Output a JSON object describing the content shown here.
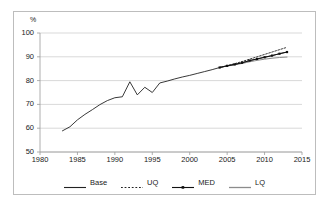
{
  "figure": {
    "caption_remnant": "",
    "background_color": "#ffffff",
    "frame_color": "#bdbdbd"
  },
  "chart_data": {
    "type": "line",
    "title": "",
    "subtitle": "",
    "xlabel": "",
    "ylabel": "%",
    "ylim": [
      50,
      100
    ],
    "xlim": [
      1980,
      2015
    ],
    "ytick_labels": [
      "100",
      "90",
      "80",
      "70",
      "60",
      "50"
    ],
    "yticks": [
      100,
      90,
      80,
      70,
      60,
      50
    ],
    "xtick_labels": [
      "1980",
      "1985",
      "1990",
      "1995",
      "2000",
      "2005",
      "2010",
      "2015"
    ],
    "xticks": [
      1980,
      1985,
      1990,
      1995,
      2000,
      2005,
      2010,
      2015
    ],
    "grid": "horizontal",
    "grid_color": "#c8c8c8",
    "legend_position": "bottom",
    "series": [
      {
        "name": "Base",
        "style": "solid",
        "color": "#222222",
        "marker": "none",
        "x": [
          1983,
          1984,
          1985,
          1986,
          1987,
          1988,
          1989,
          1990,
          1991,
          1992,
          1993,
          1994,
          1995,
          1996,
          1997,
          1998,
          1999,
          2000,
          2001,
          2002,
          2003,
          2004,
          2005,
          2006,
          2007,
          2008,
          2009,
          2010,
          2011,
          2012,
          2013
        ],
        "values": [
          58.9,
          60.6,
          63.5,
          65.8,
          67.8,
          69.9,
          71.6,
          72.8,
          73.2,
          79.5,
          74.0,
          77.2,
          75.0,
          79.0,
          79.8,
          80.7,
          81.5,
          82.2,
          83.0,
          83.8,
          84.6,
          85.5,
          86.2,
          86.8,
          87.5,
          88.4,
          89.1,
          89.8,
          90.5,
          91.3,
          92.0
        ]
      },
      {
        "name": "UQ",
        "style": "dotted",
        "color": "#222222",
        "marker": "none",
        "x": [
          2004,
          2005,
          2006,
          2007,
          2008,
          2009,
          2010,
          2011,
          2012,
          2013
        ],
        "values": [
          85.5,
          86.3,
          87.1,
          88.0,
          89.0,
          90.0,
          91.0,
          92.0,
          93.0,
          94.0
        ]
      },
      {
        "name": "MED",
        "style": "solid",
        "color": "#111111",
        "marker": "square",
        "x": [
          2004,
          2005,
          2006,
          2007,
          2008,
          2009,
          2010,
          2011,
          2012,
          2013
        ],
        "values": [
          85.5,
          86.2,
          86.8,
          87.5,
          88.4,
          89.1,
          89.8,
          90.5,
          91.3,
          92.0
        ]
      },
      {
        "name": "LQ",
        "style": "solid",
        "color": "#8c8c8c",
        "marker": "none",
        "x": [
          2004,
          2005,
          2006,
          2007,
          2008,
          2009,
          2010,
          2011,
          2012,
          2013
        ],
        "values": [
          85.5,
          86.1,
          86.6,
          87.2,
          87.9,
          88.5,
          89.0,
          89.4,
          89.7,
          89.9
        ]
      }
    ]
  },
  "legend": {
    "entries": [
      {
        "label": "Base",
        "style": "solid",
        "color": "#222222",
        "marker": "none"
      },
      {
        "label": "UQ",
        "style": "dotted",
        "color": "#222222",
        "marker": "none"
      },
      {
        "label": "MED",
        "style": "solid",
        "color": "#111111",
        "marker": "square"
      },
      {
        "label": "LQ",
        "style": "solid",
        "color": "#8c8c8c",
        "marker": "none"
      }
    ]
  }
}
